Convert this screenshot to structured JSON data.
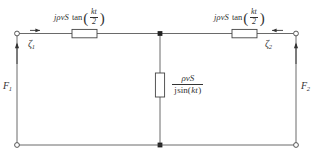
{
  "diagram": {
    "background_color": "#ffffff",
    "line_color": "#333333"
  },
  "labels": {
    "series_left": {
      "lead": "jρvS",
      "function": "tan",
      "arg_numerator": "kt",
      "arg_denominator": "2",
      "open_paren": "(",
      "close_paren": ")"
    },
    "series_right": {
      "lead": "jρvS",
      "function": "tan",
      "arg_numerator": "kt",
      "arg_denominator": "2",
      "open_paren": "(",
      "close_paren": ")"
    },
    "shunt": {
      "numerator": "ρvS",
      "denominator_lead": "j",
      "denominator_function": "sin(",
      "denominator_arg": "kt",
      "denominator_close": ")"
    },
    "port1_displacement": {
      "symbol": "ζ",
      "subscript": "1"
    },
    "port2_displacement": {
      "symbol": "ζ",
      "subscript": "2"
    },
    "port1_force": {
      "symbol": "F",
      "subscript": "1"
    },
    "port2_force": {
      "symbol": "F",
      "subscript": "2"
    }
  },
  "elements": {
    "resistor_left_name": "series-impedance-left",
    "resistor_right_name": "series-impedance-right",
    "resistor_center_name": "shunt-impedance-center",
    "node_center_name": "center-junction-node"
  }
}
